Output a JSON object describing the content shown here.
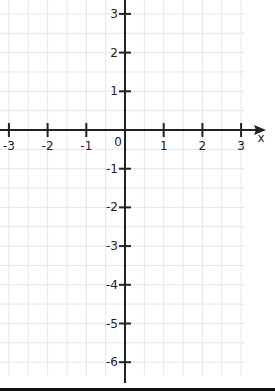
{
  "diagram": {
    "type": "coordinate-plane",
    "origin_label": "0",
    "x_axis": {
      "label": "x",
      "ticks": [
        -3,
        -2,
        -1,
        1,
        2,
        3
      ],
      "tick_labels": [
        "-3",
        "-2",
        "-1",
        "1",
        "2",
        "3"
      ]
    },
    "y_axis": {
      "ticks": [
        3,
        2,
        1,
        -1,
        -2,
        -3,
        -4,
        -5,
        -6
      ],
      "tick_labels": [
        "3",
        "2",
        "1",
        "-1",
        "-2",
        "-3",
        "-4",
        "-5",
        "-6"
      ]
    },
    "grid": {
      "step": 0.5,
      "color": "#e6e6e6"
    },
    "axis_color": "#222222"
  }
}
